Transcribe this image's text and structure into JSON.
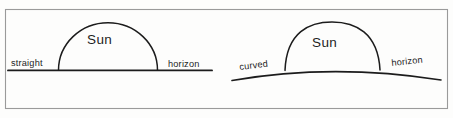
{
  "figure": {
    "background_color": "#fdfdfc",
    "ink_color": "#1c1c1c",
    "frame_color": "#9a9a9a"
  },
  "panels": [
    {
      "id": "straight-horizon",
      "horizon_label_left": "straight",
      "horizon_label_right": "horizon",
      "sun_label": "Sun",
      "horizon_type": "straight"
    },
    {
      "id": "curved-horizon",
      "horizon_label_left": "curved",
      "horizon_label_right": "horizon",
      "sun_label": "Sun",
      "horizon_type": "curved"
    }
  ]
}
